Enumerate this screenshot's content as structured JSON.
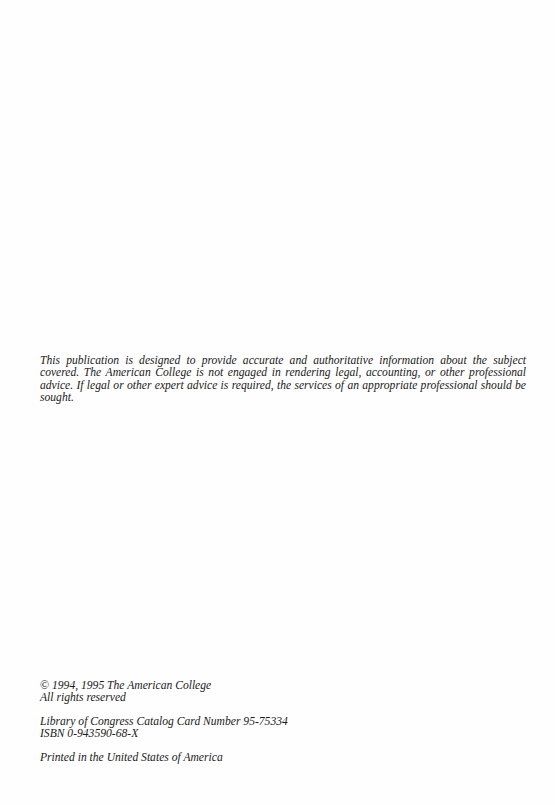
{
  "disclaimer": {
    "text": "This publication is designed to provide accurate and authoritative information about the subject covered.  The American College is not engaged in rendering legal, accounting, or other professional advice.  If legal or other expert advice is required, the services of an appropriate professional should be sought."
  },
  "colophon": {
    "copyright_symbol": "©",
    "copyright": " 1994, 1995 The American College",
    "rights": "All rights reserved",
    "loc_catalog": "Library of Congress Catalog Card Number 95-75334",
    "isbn": "ISBN 0-943590-68-X",
    "printed": "Printed in the United States of America"
  }
}
